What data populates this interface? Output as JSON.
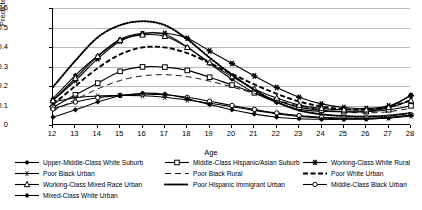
{
  "chart_data": {
    "type": "line",
    "title": "",
    "xlabel": "Age",
    "ylabel": "Predicted odds",
    "x": [
      12,
      13,
      14,
      15,
      16,
      17,
      18,
      19,
      20,
      21,
      22,
      23,
      24,
      25,
      26,
      27,
      28
    ],
    "xlim": [
      12,
      28
    ],
    "ylim": [
      0,
      0.6
    ],
    "yticks": [
      "0",
      "0.1",
      "0.2",
      "0.3",
      "0.4",
      "0.5",
      "0.6"
    ],
    "ytick_values": [
      0,
      0.1,
      0.2,
      0.3,
      0.4,
      0.5,
      0.6
    ],
    "xticks": [
      "12",
      "13",
      "14",
      "15",
      "16",
      "17",
      "18",
      "19",
      "20",
      "21",
      "22",
      "23",
      "24",
      "25",
      "26",
      "27",
      "28"
    ],
    "grid": "horizontal",
    "legend_position": "bottom",
    "series": [
      {
        "name": "Upper-Middle-Class White Suburb",
        "marker": "diamond",
        "dash": "solid",
        "values": [
          0.135,
          0.255,
          0.355,
          0.44,
          0.47,
          0.465,
          0.4,
          0.315,
          0.235,
          0.165,
          0.115,
          0.08,
          0.07,
          0.068,
          0.07,
          0.09,
          0.155
        ]
      },
      {
        "name": "Middle-Class Hispanic/Asian Suburb",
        "marker": "square",
        "dash": "solid",
        "values": [
          0.09,
          0.155,
          0.215,
          0.275,
          0.298,
          0.297,
          0.28,
          0.245,
          0.205,
          0.165,
          0.125,
          0.092,
          0.075,
          0.068,
          0.068,
          0.078,
          0.098
        ]
      },
      {
        "name": "Working-Class White Rural",
        "marker": "star",
        "dash": "solid",
        "values": [
          0.125,
          0.228,
          0.34,
          0.43,
          0.468,
          0.47,
          0.445,
          0.38,
          0.315,
          0.252,
          0.192,
          0.142,
          0.108,
          0.09,
          0.085,
          0.098,
          0.15
        ]
      },
      {
        "name": "Poor Black Urban",
        "marker": "star-thin",
        "dash": "solid",
        "values": [
          0.118,
          0.14,
          0.148,
          0.152,
          0.15,
          0.142,
          0.128,
          0.112,
          0.094,
          0.075,
          0.058,
          0.044,
          0.036,
          0.032,
          0.032,
          0.036,
          0.046
        ]
      },
      {
        "name": "Poor Black Rural",
        "marker": "none",
        "dash": "dash-long",
        "values": [
          0.072,
          0.13,
          0.185,
          0.228,
          0.252,
          0.258,
          0.248,
          0.225,
          0.195,
          0.162,
          0.128,
          0.098,
          0.078,
          0.066,
          0.062,
          0.068,
          0.086
        ]
      },
      {
        "name": "Poor White Urban",
        "marker": "none",
        "dash": "dash-heavy",
        "values": [
          0.105,
          0.2,
          0.292,
          0.362,
          0.398,
          0.398,
          0.368,
          0.318,
          0.262,
          0.208,
          0.16,
          0.12,
          0.095,
          0.082,
          0.08,
          0.092,
          0.128
        ]
      },
      {
        "name": "Working-Class Mixed Race Urban",
        "marker": "triangle",
        "dash": "solid",
        "values": [
          0.125,
          0.24,
          0.352,
          0.435,
          0.462,
          0.455,
          0.398,
          0.32,
          0.248,
          0.185,
          0.138,
          0.102,
          0.085,
          0.078,
          0.078,
          0.09,
          0.125
        ]
      },
      {
        "name": "Poor Hispanic Immigrant Urban",
        "marker": "none",
        "dash": "dotted",
        "values": [
          0.195,
          0.33,
          0.45,
          0.512,
          0.532,
          0.512,
          0.44,
          0.345,
          0.258,
          0.18,
          0.118,
          0.075,
          0.055,
          0.046,
          0.044,
          0.048,
          0.062
        ]
      },
      {
        "name": "Middle-Class Black Urban",
        "marker": "circle",
        "dash": "solid",
        "values": [
          0.082,
          0.118,
          0.14,
          0.152,
          0.158,
          0.155,
          0.142,
          0.122,
          0.1,
          0.08,
          0.062,
          0.048,
          0.04,
          0.036,
          0.036,
          0.04,
          0.052
        ]
      },
      {
        "name": "Mixed-Class White Urban",
        "marker": "diamond",
        "dash": "solid",
        "values": [
          0.04,
          0.078,
          0.118,
          0.15,
          0.163,
          0.158,
          0.135,
          0.105,
          0.078,
          0.056,
          0.04,
          0.032,
          0.029,
          0.029,
          0.03,
          0.036,
          0.05
        ]
      }
    ]
  },
  "legend": {
    "items": [
      "Upper-Middle-Class White Suburb",
      "Middle-Class Hispanic/Asian Suburb",
      "Working-Class White Rural",
      "Poor Black Urban",
      "Poor Black Rural",
      "Poor White Urban",
      "Working-Class Mixed Race Urban",
      "Poor Hispanic Immigrant Urban",
      "Middle-Class Black Urban",
      "Mixed-Class White Urban"
    ]
  },
  "caption": {
    "text": ""
  }
}
